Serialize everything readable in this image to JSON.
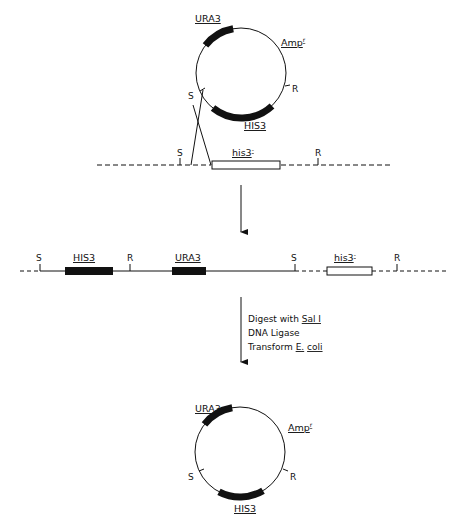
{
  "colors": {
    "ink": "#111111",
    "background": "#ffffff"
  },
  "top_plasmid": {
    "genes": {
      "ura3": "URA3",
      "his3": "HIS3",
      "amp": "Amp",
      "amp_sup": "r"
    },
    "sites": {
      "sal": "S",
      "eco": "R"
    }
  },
  "chromosome_top": {
    "sites": {
      "sal": "S",
      "eco": "R"
    },
    "gene": {
      "label": "his3",
      "sup": "-"
    }
  },
  "integrant": {
    "sites": {
      "sal_left": "S",
      "eco_left": "R",
      "sal_right": "S",
      "eco_right": "R"
    },
    "genes": {
      "his3_wt": "HIS3",
      "ura3": "URA3",
      "his3_mut": "his3",
      "his3_mut_sup": "-"
    }
  },
  "steps": {
    "line1_prefix": "Digest with ",
    "line1_enzyme": "Sal I",
    "line2": "DNA Ligase",
    "line3_prefix": "Transform ",
    "line3_genus": "E.",
    "line3_species": "coli"
  },
  "bottom_plasmid": {
    "genes": {
      "ura3": "URA3",
      "his3": "HIS3",
      "amp": "Amp",
      "amp_sup": "r"
    },
    "sites": {
      "sal": "S",
      "eco": "R"
    }
  }
}
